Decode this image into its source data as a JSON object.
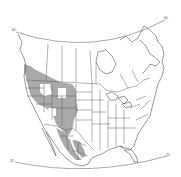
{
  "map": {
    "type": "range-map",
    "region": "North America",
    "style": "black-and-white outline with hatched range",
    "colors": {
      "background": "#ffffff",
      "lines": "#555555",
      "hatch": "#333333"
    },
    "graticule": {
      "top_left_label": "60",
      "top_right_label": "60",
      "bottom_left_label": "20",
      "bottom_right_label": "20"
    },
    "hatched_range": {
      "description": "Western North America: interior west US, Pacific Northwest, southwest Canada, northwest Mexico",
      "regions": [
        "British Columbia (south)",
        "Washington",
        "Oregon",
        "Idaho",
        "Montana",
        "Wyoming",
        "Nevada",
        "Utah",
        "Colorado",
        "Arizona",
        "New Mexico",
        "Sonora",
        "Chihuahua",
        "Durango"
      ]
    }
  }
}
